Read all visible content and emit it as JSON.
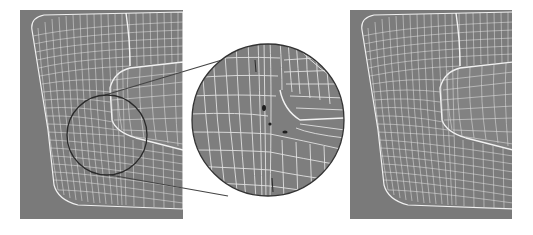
{
  "figure": {
    "background": "#ffffff",
    "panel_fill": "#7a7a7a",
    "wire_color": "#e8e8e8",
    "outline_color": "#333333",
    "panels": [
      {
        "id": "left",
        "label": "",
        "x": 20,
        "y": 10,
        "w": 163,
        "h": 209
      },
      {
        "id": "right",
        "label": "",
        "x": 350,
        "y": 10,
        "w": 162,
        "h": 209
      }
    ],
    "magnifier": {
      "source_circle": {
        "cx": 107,
        "cy": 135,
        "r": 40
      },
      "zoom_circle": {
        "cx": 268,
        "cy": 120,
        "r": 76
      },
      "defect_markers": 3
    }
  }
}
